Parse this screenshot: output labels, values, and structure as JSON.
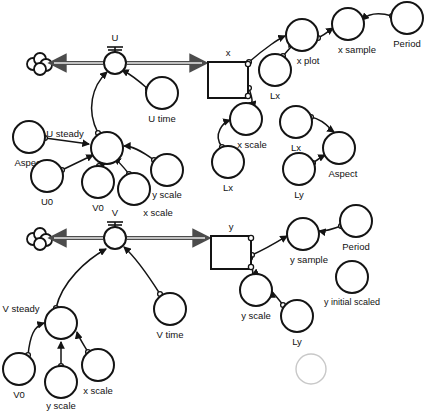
{
  "diagram": {
    "background_color": "#ffffff",
    "line_color": "#141414",
    "faint_color": "#c8c8c8",
    "stocks": [
      {
        "id": "x",
        "label": "x",
        "x": 208,
        "y": 62,
        "w": 40,
        "h": 36
      },
      {
        "id": "y",
        "label": "y",
        "x": 211,
        "y": 236,
        "w": 40,
        "h": 33
      }
    ],
    "valves": [
      {
        "id": "U",
        "label": "U",
        "x": 115,
        "y": 63
      },
      {
        "id": "V",
        "label": "V",
        "x": 115,
        "y": 238
      }
    ],
    "clouds": [
      {
        "id": "cloud-u",
        "x": 40,
        "y": 64
      },
      {
        "id": "cloud-v",
        "x": 40,
        "y": 239
      }
    ],
    "variables": [
      {
        "id": "u-time",
        "label": "U time",
        "cx": 162,
        "cy": 93,
        "r": 16,
        "label_dx": 0,
        "label_dy": 26
      },
      {
        "id": "u-steady",
        "label": "U steady",
        "cx": 107,
        "cy": 148,
        "r": 16,
        "label_dx": -42,
        "label_dy": -14
      },
      {
        "id": "aspect-left",
        "label": "Aspect",
        "cx": 29,
        "cy": 137,
        "r": 16,
        "label_dx": 0,
        "label_dy": 26
      },
      {
        "id": "u0",
        "label": "U0",
        "cx": 47,
        "cy": 176,
        "r": 16,
        "label_dx": 0,
        "label_dy": 26
      },
      {
        "id": "v0-top",
        "label": "V0",
        "cx": 98,
        "cy": 182,
        "r": 16,
        "label_dx": 0,
        "label_dy": 26
      },
      {
        "id": "x-scale-top",
        "label": "x scale",
        "cx": 134,
        "cy": 189,
        "r": 16,
        "label_dx": 24,
        "label_dy": 24
      },
      {
        "id": "y-scale-top",
        "label": "y scale",
        "cx": 167,
        "cy": 170,
        "r": 16,
        "label_dx": 0,
        "label_dy": 25
      },
      {
        "id": "x-plot",
        "label": "x plot",
        "cx": 302,
        "cy": 35,
        "r": 16,
        "label_dx": 6,
        "label_dy": 26
      },
      {
        "id": "lx-plot",
        "label": "Lx",
        "cx": 275,
        "cy": 70,
        "r": 16,
        "label_dx": 0,
        "label_dy": 26
      },
      {
        "id": "x-sample",
        "label": "x sample",
        "cx": 348,
        "cy": 24,
        "r": 16,
        "label_dx": 9,
        "label_dy": 26
      },
      {
        "id": "period-top",
        "label": "Period",
        "cx": 407,
        "cy": 18,
        "r": 16,
        "label_dx": 0,
        "label_dy": 26
      },
      {
        "id": "x-scale-mid",
        "label": "x scale",
        "cx": 246,
        "cy": 119,
        "r": 16,
        "label_dx": 6,
        "label_dy": 26
      },
      {
        "id": "lx-scale",
        "label": "Lx",
        "cx": 228,
        "cy": 162,
        "r": 16,
        "label_dx": 0,
        "label_dy": 26
      },
      {
        "id": "lx-aspect",
        "label": "Lx",
        "cx": 296,
        "cy": 122,
        "r": 16,
        "label_dx": 0,
        "label_dy": 26
      },
      {
        "id": "ly-aspect",
        "label": "Ly",
        "cx": 299,
        "cy": 169,
        "r": 16,
        "label_dx": 0,
        "label_dy": 26
      },
      {
        "id": "aspect-right",
        "label": "Aspect",
        "cx": 339,
        "cy": 148,
        "r": 16,
        "label_dx": 4,
        "label_dy": 26
      },
      {
        "id": "v-time",
        "label": "V time",
        "cx": 170,
        "cy": 309,
        "r": 16,
        "label_dx": 0,
        "label_dy": 26
      },
      {
        "id": "v-steady",
        "label": "V steady",
        "cx": 61,
        "cy": 323,
        "r": 16,
        "label_dx": -40,
        "label_dy": -14
      },
      {
        "id": "v0-bottom",
        "label": "V0",
        "cx": 19,
        "cy": 369,
        "r": 16,
        "label_dx": 0,
        "label_dy": 26
      },
      {
        "id": "y-scale-bottom",
        "label": "y scale",
        "cx": 61,
        "cy": 382,
        "r": 16,
        "label_dx": 0,
        "label_dy": 24
      },
      {
        "id": "x-scale-bottom",
        "label": "x scale",
        "cx": 98,
        "cy": 365,
        "r": 16,
        "label_dx": 0,
        "label_dy": 26
      },
      {
        "id": "y-sample",
        "label": "y sample",
        "cx": 303,
        "cy": 234,
        "r": 16,
        "label_dx": 6,
        "label_dy": 26
      },
      {
        "id": "period-bottom",
        "label": "Period",
        "cx": 356,
        "cy": 221,
        "r": 16,
        "label_dx": 0,
        "label_dy": 26
      },
      {
        "id": "y-scale-right",
        "label": "y scale",
        "cx": 256,
        "cy": 290,
        "r": 16,
        "label_dx": 0,
        "label_dy": 26
      },
      {
        "id": "ly-scale",
        "label": "Ly",
        "cx": 297,
        "cy": 316,
        "r": 16,
        "label_dx": 0,
        "label_dy": 26
      },
      {
        "id": "y-initial-scaled",
        "label": "y initial scaled",
        "cx": 352,
        "cy": 277,
        "r": 16,
        "label_dx": 0,
        "label_dy": 26
      },
      {
        "id": "faint-node",
        "label": "",
        "cx": 311,
        "cy": 369,
        "r": 15,
        "label_dx": 0,
        "label_dy": 26,
        "faint": true
      }
    ],
    "links": [
      {
        "id": "u-time-to-u",
        "d": "M 148 89 C 138 80 130 74 122 70"
      },
      {
        "id": "u-steady-to-u",
        "d": "M 98 133 C 86 110 92 86 107 72"
      },
      {
        "id": "aspect-to-usteady",
        "d": "M 45 138 L 89 144"
      },
      {
        "id": "u0-to-usteady",
        "d": "M 62 170 L 93 155"
      },
      {
        "id": "v0-to-usteady",
        "d": "M 99 166 L 105 164"
      },
      {
        "id": "xscale-to-usteady",
        "d": "M 129 174 C 121 164 117 160 114 158"
      },
      {
        "id": "yscale-to-usteady",
        "d": "M 154 160 C 140 150 132 146 124 146"
      },
      {
        "id": "x-to-xplot",
        "d": "M 249 62 C 265 48 280 38 285 36"
      },
      {
        "id": "lx-to-xplot",
        "d": "M 283 56 C 290 48 293 44 295 44"
      },
      {
        "id": "xplot-to-xsample",
        "d": "M 318 38 C 326 34 330 30 333 28"
      },
      {
        "id": "period-to-xsample",
        "d": "M 392 16 C 378 12 368 14 362 20"
      },
      {
        "id": "x-to-xscale",
        "d": "M 249 88 C 252 98 254 104 249 103"
      },
      {
        "id": "lxscale-to-xscale",
        "d": "M 222 147 C 212 134 224 122 230 120"
      },
      {
        "id": "lx-to-aspectright",
        "d": "M 311 117 C 325 120 331 130 334 132"
      },
      {
        "id": "ly-to-aspectright",
        "d": "M 313 163 C 321 157 325 155 325 155"
      },
      {
        "id": "v-time-to-v",
        "d": "M 160 294 C 146 272 134 256 124 247"
      },
      {
        "id": "v-steady-to-v",
        "d": "M 56 308 C 62 282 86 260 106 249"
      },
      {
        "id": "v0b-to-vsteady",
        "d": "M 28 355 C 30 336 34 326 44 323"
      },
      {
        "id": "yscaleb-to-vsteady",
        "d": "M 61 366 L 61 342"
      },
      {
        "id": "xscaleb-to-vsteady",
        "d": "M 88 352 C 82 342 78 336 77 332"
      },
      {
        "id": "y-to-ysample",
        "d": "M 252 255 C 268 248 282 239 287 236"
      },
      {
        "id": "period-to-ysample",
        "d": "M 341 226 C 330 230 324 232 319 231"
      },
      {
        "id": "y-to-yscale",
        "d": "M 250 258 C 252 268 254 274 252 275"
      },
      {
        "id": "lyscale-to-yscale",
        "d": "M 283 305 C 276 296 272 292 272 291"
      }
    ]
  }
}
